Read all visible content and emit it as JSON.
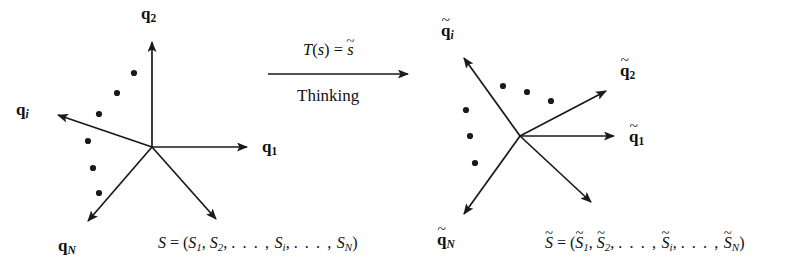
{
  "figure": {
    "background_color": "#ffffff",
    "stroke_color": "#1a1a1a",
    "canvas": {
      "width": 800,
      "height": 270
    }
  },
  "transform": {
    "formula_prefix": "T",
    "formula_open": "(",
    "formula_arg": "s",
    "formula_close": ")",
    "formula_equals": " = ",
    "formula_result": "s",
    "label_below": "Thinking",
    "arrow_direction": "right"
  },
  "left_diagram": {
    "name": "original-basis",
    "origin": {
      "x": 152,
      "y": 147
    },
    "axes": [
      {
        "id": "q2",
        "base": "q",
        "subscript": "2",
        "subscript_style": "upright",
        "tilde": false,
        "tip": {
          "x": 152,
          "y": 38
        },
        "label_pos": {
          "x": 142,
          "y": 4
        }
      },
      {
        "id": "q1",
        "base": "q",
        "subscript": "1",
        "subscript_style": "upright",
        "tilde": false,
        "tip": {
          "x": 253,
          "y": 147
        },
        "label_pos": {
          "x": 262,
          "y": 137
        }
      },
      {
        "id": "qi",
        "base": "q",
        "subscript": "i",
        "subscript_style": "italic",
        "tilde": false,
        "tip": {
          "x": 52,
          "y": 113
        },
        "label_pos": {
          "x": 16,
          "y": 100
        }
      },
      {
        "id": "qN",
        "base": "q",
        "subscript": "N",
        "subscript_style": "italic",
        "tilde": false,
        "tip": {
          "x": 82,
          "y": 228
        },
        "label_pos": {
          "x": 58,
          "y": 236
        }
      },
      {
        "id": "S",
        "base": "S",
        "subscript": "",
        "subscript_style": "none",
        "tilde": false,
        "tip": {
          "x": 222,
          "y": 226
        },
        "label_pos": null
      }
    ],
    "dots": [
      {
        "x": 152,
        "y": 147,
        "note": "origin-marker-excluded"
      }
    ],
    "ellipsis_dots": [
      {
        "x": 134,
        "y": 73
      },
      {
        "x": 117,
        "y": 93
      },
      {
        "x": 99,
        "y": 113
      },
      {
        "x": 88,
        "y": 141
      },
      {
        "x": 93,
        "y": 168
      },
      {
        "x": 99,
        "y": 193
      }
    ],
    "state_label": {
      "lhs": "S",
      "equals": " = ",
      "open": "(",
      "items": [
        "S",
        "S",
        "S",
        "S"
      ],
      "subs": [
        "1",
        "2",
        "i",
        "N"
      ],
      "dots": ". . . ,",
      "close": ")",
      "pos": {
        "x": 158,
        "y": 234
      }
    }
  },
  "right_diagram": {
    "name": "transformed-basis",
    "origin": {
      "x": 520,
      "y": 136
    },
    "axes": [
      {
        "id": "q2t",
        "base": "q",
        "subscript": "2",
        "subscript_style": "upright",
        "tilde": true,
        "tip": {
          "x": 613,
          "y": 87
        },
        "label_pos": {
          "x": 620,
          "y": 58
        }
      },
      {
        "id": "q1t",
        "base": "q",
        "subscript": "1",
        "subscript_style": "upright",
        "tilde": true,
        "tip": {
          "x": 620,
          "y": 136
        },
        "label_pos": {
          "x": 629,
          "y": 124
        }
      },
      {
        "id": "qit",
        "base": "q",
        "subscript": "i",
        "subscript_style": "italic",
        "tilde": true,
        "tip": {
          "x": 458,
          "y": 52
        },
        "label_pos": {
          "x": 441,
          "y": 18
        }
      },
      {
        "id": "qNt",
        "base": "q",
        "subscript": "N",
        "subscript_style": "italic",
        "tilde": true,
        "tip": {
          "x": 458,
          "y": 221
        },
        "label_pos": {
          "x": 437,
          "y": 228
        }
      },
      {
        "id": "St",
        "base": "S",
        "subscript": "",
        "subscript_style": "none",
        "tilde": true,
        "tip": {
          "x": 597,
          "y": 209
        },
        "label_pos": null
      }
    ],
    "ellipsis_dots": [
      {
        "x": 503,
        "y": 86
      },
      {
        "x": 527,
        "y": 92
      },
      {
        "x": 551,
        "y": 100
      },
      {
        "x": 466,
        "y": 110
      },
      {
        "x": 470,
        "y": 136
      },
      {
        "x": 475,
        "y": 163
      }
    ],
    "state_label": {
      "lhs": "S",
      "equals": " = ",
      "open": "(",
      "items": [
        "S",
        "S",
        "S",
        "S"
      ],
      "subs": [
        "1",
        "2",
        "i",
        "N"
      ],
      "dots": ". . . ,",
      "close": ")",
      "pos": {
        "x": 545,
        "y": 232
      }
    }
  },
  "glyphs": {
    "tilde": "~",
    "comma": ",",
    "ellipsis": ". . . ,"
  }
}
